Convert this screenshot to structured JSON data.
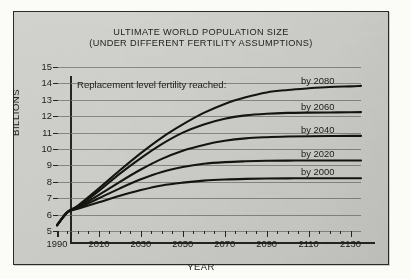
{
  "chart_data": {
    "type": "line",
    "title": "ULTIMATE WORLD POPULATION SIZE",
    "subtitle": "(UNDER DIFFERENT FERTILITY ASSUMPTIONS)",
    "xlabel": "YEAR",
    "ylabel": "BILLIONS",
    "annotation": "Replacement level fertility reached:",
    "xlim": [
      1990,
      2135
    ],
    "ylim": [
      5,
      15
    ],
    "grid": true,
    "legend_position": "inline-right",
    "y_ticks": [
      15,
      14,
      13,
      12,
      11,
      10,
      9,
      8,
      7,
      6,
      5
    ],
    "x_ticks": [
      1990,
      2010,
      2030,
      2050,
      2070,
      2090,
      2110,
      2130
    ],
    "x_minor_tick_step": 5,
    "x": [
      1990,
      1995,
      2000,
      2010,
      2020,
      2030,
      2040,
      2050,
      2060,
      2070,
      2080,
      2090,
      2100,
      2110,
      2120,
      2130,
      2135
    ],
    "series": [
      {
        "name": "by 2080",
        "label": "by 2080",
        "values": [
          5.35,
          6.15,
          6.55,
          7.6,
          8.7,
          9.75,
          10.7,
          11.5,
          12.2,
          12.75,
          13.15,
          13.45,
          13.6,
          13.7,
          13.78,
          13.82,
          13.85
        ]
      },
      {
        "name": "by 2060",
        "label": "by 2060",
        "values": [
          5.35,
          6.15,
          6.5,
          7.45,
          8.5,
          9.45,
          10.3,
          11.0,
          11.5,
          11.85,
          12.05,
          12.15,
          12.2,
          12.22,
          12.23,
          12.24,
          12.25
        ]
      },
      {
        "name": "by 2040",
        "label": "by 2040",
        "values": [
          5.35,
          6.15,
          6.45,
          7.2,
          8.0,
          8.75,
          9.4,
          9.9,
          10.25,
          10.5,
          10.65,
          10.72,
          10.76,
          10.78,
          10.79,
          10.8,
          10.8
        ]
      },
      {
        "name": "by 2020",
        "label": "by 2020",
        "values": [
          5.35,
          6.15,
          6.4,
          7.0,
          7.6,
          8.15,
          8.6,
          8.9,
          9.1,
          9.2,
          9.25,
          9.28,
          9.29,
          9.3,
          9.3,
          9.3,
          9.3
        ]
      },
      {
        "name": "by 2000",
        "label": "by 2000",
        "values": [
          5.35,
          6.15,
          6.35,
          6.75,
          7.15,
          7.5,
          7.78,
          7.95,
          8.07,
          8.14,
          8.18,
          8.2,
          8.21,
          8.22,
          8.22,
          8.22,
          8.22
        ]
      }
    ]
  },
  "colors": {
    "background": "#d1d1cd",
    "frame": "#2a2a28",
    "curve": "#15150f",
    "grid": "#6e6e68",
    "text": "#1d1d18"
  }
}
